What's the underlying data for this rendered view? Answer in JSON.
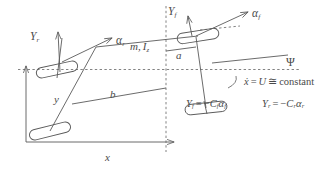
{
  "figure": {
    "type": "vehicle-bicycle-model-diagram",
    "stroke_color": "#5a5a5a",
    "text_color": "#4a4a4a",
    "labels": {
      "rear_force": {
        "base": "Y",
        "sub": "r"
      },
      "rear_slip": {
        "base": "α",
        "sub": "r"
      },
      "front_force": {
        "base": "Y",
        "sub": "f"
      },
      "front_slip": {
        "base": "α",
        "sub": "f"
      },
      "mass_inertia": {
        "mass": "m,",
        "inertia": "I",
        "inertia_sub": "z"
      },
      "dist_front": "a",
      "dist_rear": "b",
      "yaw_angle": "Ψ",
      "axis_x": "x",
      "axis_y": "y"
    },
    "equations": {
      "speed": {
        "lhs": "ẋ",
        "eq1": "=",
        "mid": "U",
        "eq2": "≅",
        "rhs": "constant"
      },
      "front_lateral_force": {
        "lhs_base": "Y",
        "lhs_sub": "f",
        "eq": "=",
        "sign": "−",
        "coef_base": "C",
        "coef_sub": "f",
        "slip_base": "α",
        "slip_sub": "f"
      },
      "rear_lateral_force": {
        "lhs_base": "Y",
        "lhs_sub": "r",
        "eq": "=",
        "sign": "−",
        "coef_base": "C",
        "coef_sub": "r",
        "slip_base": "α",
        "slip_sub": "r"
      }
    }
  }
}
